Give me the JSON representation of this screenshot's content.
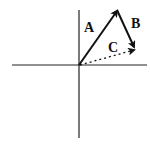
{
  "diagram": {
    "type": "vector-addition",
    "vectors": [
      {
        "id": "A",
        "label": "A",
        "from": "origin",
        "to": "tip-A",
        "style": "solid"
      },
      {
        "id": "B",
        "label": "B",
        "from": "tip-A",
        "to": "tip-B",
        "style": "solid"
      },
      {
        "id": "C",
        "label": "C",
        "from": "origin",
        "to": "tip-B",
        "style": "dotted"
      }
    ],
    "axes": {
      "x": "horizontal",
      "y": "vertical"
    },
    "colors": {
      "stroke": "#111111",
      "background": "#ffffff"
    }
  }
}
